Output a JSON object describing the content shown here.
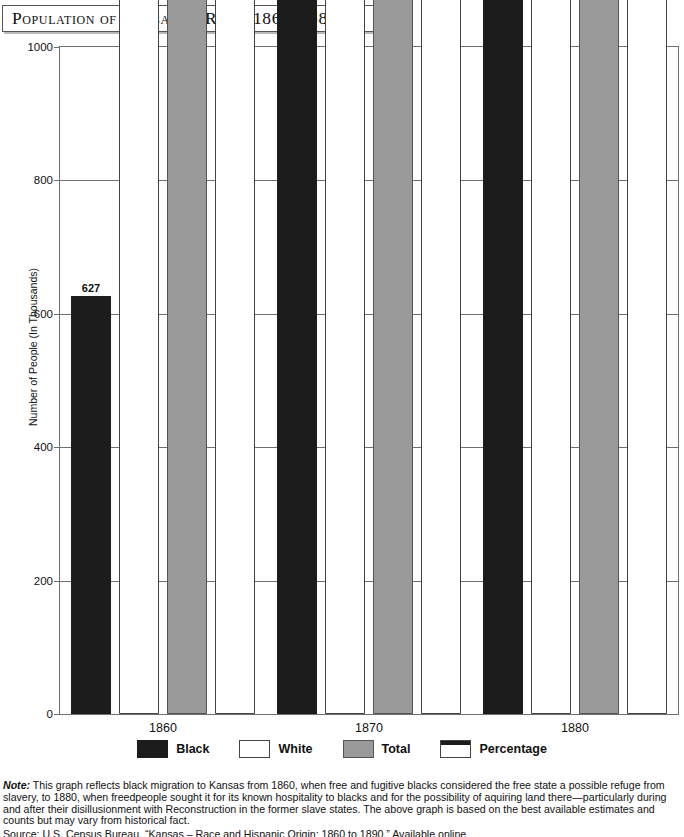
{
  "title": "Population of Kansas by Race, 1860–1880",
  "axis": {
    "ylabel": "Number of People (In Thousands)",
    "yticks": [
      0,
      200,
      400,
      600,
      800,
      1000
    ],
    "ymin": 0,
    "ymax": 1000
  },
  "legend": [
    {
      "label": "Black",
      "key": "black",
      "color": "#1c1c1c"
    },
    {
      "label": "White",
      "key": "white",
      "color": "#ffffff"
    },
    {
      "label": "Total",
      "key": "total",
      "color": "#9a9a9a"
    },
    {
      "label": "Percentage",
      "key": "pct",
      "color": "#ffffff"
    }
  ],
  "note_prefix": "Note:",
  "note": " This graph reflects black migration to Kansas from 1860, when free and fugitive blacks considered the free state a possible refuge from slavery, to 1880, when freedpeople sought it for its known hospitality to blacks and for the possibility of aquiring land there—particularly during and after their disillusionment with Reconstruction in the former slave states. The above graph is based on the best available estimates and counts but may vary from historical fact.",
  "source": "Source: U.S. Census Bureau, “Kansas – Race and Hispanic Origin: 1860 to 1890,” Available online",
  "chart_data": {
    "type": "bar",
    "title": "Population of Kansas by Race, 1860–1880",
    "xlabel": "",
    "ylabel": "Number of People (In Thousands)",
    "ylim": [
      0,
      1000
    ],
    "grid": true,
    "legend_position": "bottom",
    "categories": [
      "1860",
      "1870",
      "1880"
    ],
    "series": [
      {
        "name": "Black",
        "values": [
          627,
          17108,
          43107
        ],
        "labels": [
          "627",
          "17,108",
          "43,107"
        ]
      },
      {
        "name": "White",
        "values": [
          106390,
          346377,
          952155
        ],
        "labels": [
          "106,390",
          "346,377",
          "952,155"
        ]
      },
      {
        "name": "Total",
        "values": [
          107206,
          364399,
          996096
        ],
        "labels": [
          "107,206",
          "364,399",
          "996,096"
        ]
      },
      {
        "name": "Percentage",
        "black_pct": [
          0.6,
          4.7,
          4.3
        ],
        "white_pct": [
          99.2,
          95.1,
          95.6
        ],
        "black_labels": [
          "0.6 %",
          "4.7 %",
          "4.3 %"
        ],
        "white_labels": [
          "99.2 %",
          "95.1 %",
          "95.6 %"
        ]
      }
    ],
    "groups": [
      {
        "category": "1860",
        "bars": [
          {
            "series": "Black",
            "value": 627,
            "label": "627"
          },
          {
            "series": "White",
            "value": 106390,
            "label": "106,390"
          },
          {
            "series": "Total",
            "value": 107206,
            "label": "107,206"
          },
          {
            "series": "Percentage",
            "value": 107206,
            "black_label": "0.6 %",
            "white_label": "99.2 %",
            "black_pct": 0.6,
            "white_pct": 99.2,
            "label_outside": true
          }
        ]
      },
      {
        "category": "1870",
        "bars": [
          {
            "series": "Black",
            "value": 17108,
            "label": "17,108"
          },
          {
            "series": "White",
            "value": 346377,
            "label": "346,377"
          },
          {
            "series": "Total",
            "value": 364399,
            "label": "364,399"
          },
          {
            "series": "Percentage",
            "value": 364399,
            "black_label": "4.7 %",
            "white_label": "95.1 %",
            "black_pct": 4.7,
            "white_pct": 95.1,
            "label_outside": true
          }
        ]
      },
      {
        "category": "1880",
        "bars": [
          {
            "series": "Black",
            "value": 43107,
            "label": "43,107"
          },
          {
            "series": "White",
            "value": 952155,
            "label": "952,155"
          },
          {
            "series": "Total",
            "value": 996096,
            "label": "996,096"
          },
          {
            "series": "Percentage",
            "value": 996096,
            "black_label": "4.3 %",
            "white_label": "95.6 %",
            "black_pct": 4.3,
            "white_pct": 95.6,
            "label_outside": false
          }
        ]
      }
    ]
  }
}
